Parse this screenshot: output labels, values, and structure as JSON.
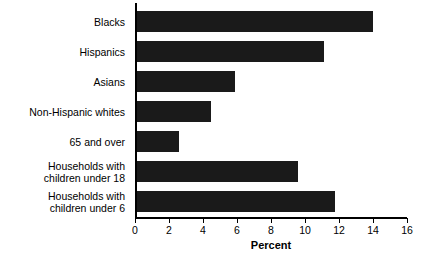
{
  "chart_data": {
    "type": "bar",
    "orientation": "horizontal",
    "title": "",
    "xlabel": "Percent",
    "ylabel": "",
    "xlim": [
      0,
      16
    ],
    "xticks": [
      0,
      2,
      4,
      6,
      8,
      10,
      12,
      14,
      16
    ],
    "xtick_labels": [
      "0",
      "2",
      "4",
      "6",
      "8",
      "10",
      "12",
      "14",
      "16"
    ],
    "grid": false,
    "legend": null,
    "bar_color": "#1a1a1a",
    "background_color": "#ffffff",
    "categories": [
      "Blacks",
      "Hispanics",
      "Asians",
      "Non-Hispanic whites",
      "65 and over",
      "Households with\nchildren under 18",
      "Households with\nchildren under 6"
    ],
    "values": [
      13.9,
      11.0,
      5.8,
      4.4,
      2.5,
      9.5,
      11.7
    ]
  }
}
